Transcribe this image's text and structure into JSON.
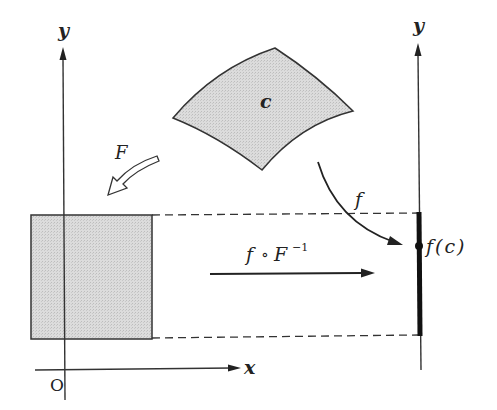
{
  "diagram": {
    "left_axes": {
      "y_label": "y",
      "x_label": "x",
      "origin_label": "O"
    },
    "right_axis": {
      "y_label": "y"
    },
    "region_c": {
      "label": "c"
    },
    "mapping_F": {
      "label": "F"
    },
    "mapping_f": {
      "label": "f"
    },
    "composite_map": {
      "label_f": "f",
      "label_circ": "∘",
      "label_F": "F",
      "label_exp": "−1"
    },
    "image_point": {
      "label": "f(c)"
    },
    "colors": {
      "ink": "#222222",
      "fill_gray": "#d4d4d4",
      "background": "#ffffff"
    }
  }
}
